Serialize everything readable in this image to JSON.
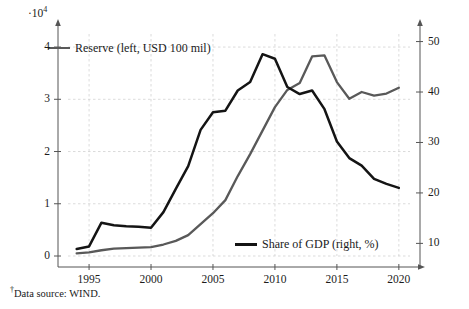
{
  "figure": {
    "multiplier_prefix": "·10",
    "multiplier_exp": "4",
    "footnote_marker": "†",
    "footnote_text": "Data source: WIND."
  },
  "legend": {
    "reserve": {
      "label": "Reserve (left, USD 100 mil)",
      "color": "#595959"
    },
    "share": {
      "label": "Share of GDP (right, %)",
      "color": "#141414"
    }
  },
  "chart_data": {
    "type": "line",
    "title": "",
    "xlabel": "",
    "ylabel": "",
    "grid": true,
    "legend_position": "inside",
    "x": [
      1994,
      1995,
      1996,
      1997,
      1998,
      1999,
      2000,
      2001,
      2002,
      2003,
      2004,
      2005,
      2006,
      2007,
      2008,
      2009,
      2010,
      2011,
      2012,
      2013,
      2014,
      2015,
      2016,
      2017,
      2018,
      2019,
      2020
    ],
    "xlim": [
      1993.3,
      2020.9
    ],
    "xticks": [
      1995,
      2000,
      2005,
      2010,
      2015,
      2020
    ],
    "xtick_labels": [
      "1995",
      "2000",
      "2005",
      "2010",
      "2015",
      "2020"
    ],
    "left_axis": {
      "label": "Reserve (left, USD 100 mil)",
      "multiplier": "·10⁴",
      "ylim": [
        0,
        4.25
      ],
      "yticks": [
        0,
        1,
        2,
        3,
        4
      ],
      "ytick_labels": [
        "0",
        "1",
        "2",
        "3",
        "4"
      ]
    },
    "right_axis": {
      "label": "Share of GDP (right, %)",
      "ylim": [
        7.5,
        51.5
      ],
      "yticks": [
        10,
        20,
        30,
        40,
        50
      ],
      "ytick_labels": [
        "10",
        "20",
        "30",
        "40",
        "50"
      ]
    },
    "series": [
      {
        "name": "Reserve (left, USD 100 mil)",
        "axis": "left",
        "units": "×10⁴ USD 100 mil",
        "color": "#595959",
        "values": [
          0.05,
          0.07,
          0.11,
          0.14,
          0.15,
          0.16,
          0.17,
          0.22,
          0.29,
          0.4,
          0.61,
          0.82,
          1.07,
          1.53,
          1.95,
          2.4,
          2.85,
          3.18,
          3.31,
          3.82,
          3.84,
          3.33,
          3.01,
          3.14,
          3.07,
          3.11,
          3.22
        ]
      },
      {
        "name": "Share of GDP (right, %)",
        "axis": "right",
        "units": "%",
        "color": "#141414",
        "values": [
          8.9,
          9.4,
          14.1,
          13.6,
          13.4,
          13.3,
          13.1,
          16.2,
          20.8,
          25.3,
          32.5,
          36.0,
          36.3,
          40.3,
          42.0,
          47.5,
          46.6,
          41.0,
          39.6,
          40.3,
          36.6,
          30.2,
          26.9,
          25.4,
          22.8,
          21.8,
          21.0
        ]
      }
    ]
  }
}
